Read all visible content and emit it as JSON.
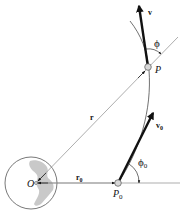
{
  "figure": {
    "type": "orbital-mechanics-diagram",
    "labels": {
      "velocity": "v",
      "angle_phi": "ϕ",
      "point_p": "P",
      "radius": "r",
      "velocity_0": "v",
      "velocity_0_sub": "0",
      "angle_phi_0": "ϕ",
      "angle_phi_0_sub": "0",
      "origin": "O",
      "radius_0": "r",
      "radius_0_sub": "0",
      "point_p0": "P",
      "point_p0_sub": "0"
    },
    "colors": {
      "line": "#8a8a8a",
      "vector": "#111111",
      "earth_land": "#c9c9c9",
      "point_fill": "#d8d8d8"
    }
  }
}
